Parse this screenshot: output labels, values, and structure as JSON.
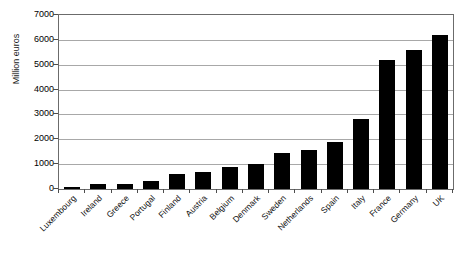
{
  "chart_data": {
    "type": "bar",
    "title": "",
    "xlabel": "",
    "ylabel": "Million euros",
    "ylim": [
      0,
      7000
    ],
    "ytick_labels": [
      "7000",
      "6000",
      "5000",
      "4000",
      "3000",
      "2000",
      "1000",
      "0"
    ],
    "yticks": [
      7000,
      6000,
      5000,
      4000,
      3000,
      2000,
      1000,
      0
    ],
    "grid": true,
    "legend": "none",
    "bar_color": "#000000",
    "categories": [
      "Luxembourg",
      "Ireland",
      "Greece",
      "Portugal",
      "Finland",
      "Austria",
      "Belgium",
      "Denmark",
      "Sweden",
      "Netherlands",
      "Spain",
      "Italy",
      "France",
      "Germany",
      "UK"
    ],
    "values": [
      80,
      200,
      220,
      320,
      620,
      700,
      880,
      1020,
      1450,
      1550,
      1900,
      2800,
      5200,
      5600,
      6200
    ]
  }
}
